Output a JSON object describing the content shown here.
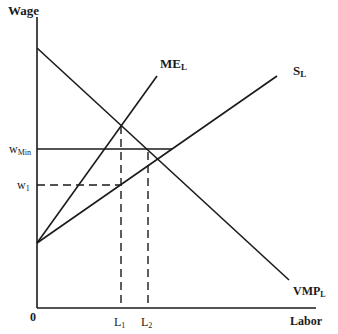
{
  "diagram": {
    "type": "economics-labor-market-monopsony-minimum-wage",
    "axes": {
      "y_label": "Wage",
      "x_label": "Labor",
      "origin_label": "0"
    },
    "curves": [
      {
        "id": "vmp",
        "label_main": "VMP",
        "label_sub": "L"
      },
      {
        "id": "me",
        "label_main": "ME",
        "label_sub": "L"
      },
      {
        "id": "supply",
        "label_main": "S",
        "label_sub": "L"
      }
    ],
    "y_markers": [
      {
        "id": "wmin",
        "label_main": "w",
        "label_sub": "Min",
        "style": "solid"
      },
      {
        "id": "w1",
        "label_main": "w",
        "label_sub": "1",
        "style": "dashed"
      }
    ],
    "x_markers": [
      {
        "id": "L1",
        "label_main": "L",
        "label_sub": "1"
      },
      {
        "id": "L2",
        "label_main": "L",
        "label_sub": "2"
      }
    ]
  }
}
